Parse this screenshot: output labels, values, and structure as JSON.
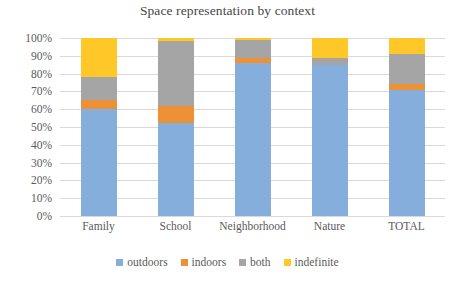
{
  "chart_data": {
    "type": "bar",
    "subtype": "stacked-100-percent",
    "title": "Space representation by context",
    "xlabel": "",
    "ylabel": "",
    "ylim": [
      0,
      100
    ],
    "grid": true,
    "legend_position": "bottom",
    "categories": [
      "Family",
      "School",
      "Neighborhood",
      "Nature",
      "TOTAL"
    ],
    "ytick_labels": [
      "0%",
      "10%",
      "20%",
      "30%",
      "40%",
      "50%",
      "60%",
      "70%",
      "80%",
      "90%",
      "100%"
    ],
    "ytick_values": [
      0,
      10,
      20,
      30,
      40,
      50,
      60,
      70,
      80,
      90,
      100
    ],
    "series": [
      {
        "name": "outdoors",
        "color": "#85AEDC",
        "values": [
          60,
          52,
          86,
          85,
          71
        ]
      },
      {
        "name": "indoors",
        "color": "#ED9137",
        "values": [
          5,
          10,
          3,
          0,
          3
        ]
      },
      {
        "name": "both",
        "color": "#A5A5A5",
        "values": [
          13,
          36.5,
          10,
          4,
          17
        ]
      },
      {
        "name": "indefinite",
        "color": "#FFC728",
        "values": [
          22,
          1.5,
          1,
          11,
          9
        ]
      }
    ]
  },
  "colors": {
    "outdoors": "#85AEDC",
    "indoors": "#ED9137",
    "both": "#A5A5A5",
    "indefinite": "#FFC728",
    "gridline": "#d9d9d9",
    "text": "#5a5a5a",
    "title_text": "#464646",
    "background": "#ffffff"
  }
}
